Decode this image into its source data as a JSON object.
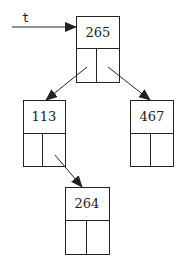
{
  "diagram": {
    "type": "binary-search-tree",
    "pointer": {
      "label": "t"
    },
    "nodes": [
      {
        "id": "root",
        "value": "265"
      },
      {
        "id": "left",
        "value": "113"
      },
      {
        "id": "right",
        "value": "467"
      },
      {
        "id": "left-right",
        "value": "264"
      }
    ],
    "edges": [
      {
        "from": "t",
        "to": "root"
      },
      {
        "from": "root",
        "to": "left"
      },
      {
        "from": "root",
        "to": "right"
      },
      {
        "from": "left",
        "to": "left-right"
      }
    ]
  }
}
